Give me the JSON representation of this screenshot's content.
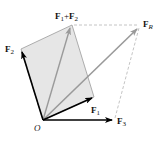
{
  "diagram": {
    "colors": {
      "parallelogram_fill": "#e6e6e6",
      "parallelogram_edge": "#9a9a9a",
      "force_arrow": "#000000",
      "resultant_arrow": "#9a9a9a",
      "dashed_line": "#b5b5b5"
    },
    "origin": {
      "label": "O",
      "x": 43,
      "y": 120
    },
    "vectors": [
      {
        "id": "F1",
        "label": "F",
        "sub": "1",
        "tip": [
          94,
          97
        ],
        "label_pos": [
          91,
          113
        ],
        "style": "force"
      },
      {
        "id": "F2",
        "label": "F",
        "sub": "2",
        "tip": [
          21,
          49
        ],
        "label_pos": [
          6,
          52
        ],
        "style": "force"
      },
      {
        "id": "F3",
        "label": "F",
        "sub": "3",
        "tip": [
          113,
          120
        ],
        "label_pos": [
          117,
          124
        ],
        "style": "force"
      },
      {
        "id": "F1+F2",
        "label": "F",
        "sub": "1",
        "plus": "+",
        "label2": "F",
        "sub2": "2",
        "tip": [
          71,
          26
        ],
        "label_pos": [
          54,
          19
        ],
        "style": "resultant"
      },
      {
        "id": "FR",
        "label": "F",
        "sub": "R",
        "tip": [
          139,
          27
        ],
        "label_pos": [
          142,
          25
        ],
        "style": "resultant"
      }
    ],
    "parallelogram": [
      [
        43,
        120
      ],
      [
        21,
        49
      ],
      [
        72,
        25
      ],
      [
        94,
        97
      ]
    ],
    "dashed_lines": [
      {
        "from": [
          73,
          25
        ],
        "to": [
          139,
          25
        ]
      },
      {
        "from": [
          115,
          118
        ],
        "to": [
          139,
          28
        ]
      }
    ]
  }
}
